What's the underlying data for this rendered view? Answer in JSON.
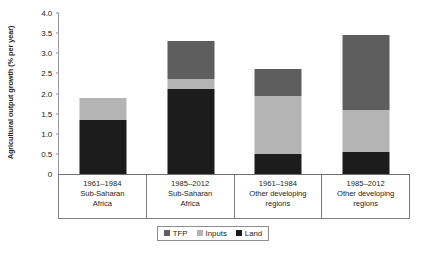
{
  "chart_data": {
    "type": "bar",
    "subtype": "stacked-bar",
    "title": "",
    "subtitle": "",
    "xlabel": "",
    "ylabel": "Agricultural output growth (% per year)",
    "ylim": [
      0,
      4.0
    ],
    "yticks": [
      "0",
      "0.5",
      "1.0",
      "1.5",
      "2.0",
      "2.5",
      "3.0",
      "3.5",
      "4.0"
    ],
    "ytick_values": [
      0,
      0.5,
      1.0,
      1.5,
      2.0,
      2.5,
      3.0,
      3.5,
      4.0
    ],
    "grid": false,
    "legend_position": "bottom-center",
    "categories": [
      "1961–1984 Sub-Saharan Africa",
      "1985–2012 Sub-Saharan Africa",
      "1961–1984 Other developing regions",
      "1985–2012 Other developing regions"
    ],
    "category_labels": [
      {
        "period": "1961–1984",
        "region_line1": "Sub-Saharan",
        "region_line2": "Africa"
      },
      {
        "period": "1985–2012",
        "region_line1": "Sub-Saharan",
        "region_line2": "Africa"
      },
      {
        "period": "1961–1984",
        "region_line1": "Other developing",
        "region_line2": "regions"
      },
      {
        "period": "1985–2012",
        "region_line1": "Other developing",
        "region_line2": "regions"
      }
    ],
    "series": [
      {
        "name": "Land",
        "color": "#1c1c1c",
        "values": [
          1.35,
          2.1,
          0.5,
          0.55
        ]
      },
      {
        "name": "Inputs",
        "color": "#b4b4b4",
        "values": [
          0.55,
          0.25,
          1.45,
          1.05
        ]
      },
      {
        "name": "TFP",
        "color": "#5e5e5e",
        "values": [
          0.0,
          0.95,
          0.65,
          1.85
        ]
      }
    ],
    "totals": [
      1.9,
      3.3,
      2.6,
      3.45
    ],
    "legend": [
      {
        "label": "TFP",
        "color": "#5e5e5e"
      },
      {
        "label": "Inputs",
        "color": "#b4b4b4"
      },
      {
        "label": "Land",
        "color": "#1c1c1c"
      }
    ]
  }
}
